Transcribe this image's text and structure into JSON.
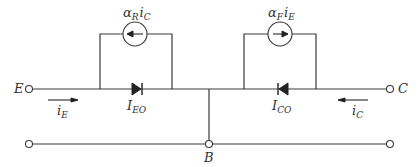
{
  "diagram": {
    "terminals": {
      "emitter": "E",
      "collector": "C",
      "base": "B"
    },
    "sources": {
      "reverse": {
        "coef": "α",
        "coef_sub": "R",
        "var": "i",
        "var_sub": "C"
      },
      "forward": {
        "coef": "α",
        "coef_sub": "F",
        "var": "i",
        "var_sub": "E"
      }
    },
    "diodes": {
      "emitter_diode": {
        "main": "I",
        "sub": "EO"
      },
      "collector_diode": {
        "main": "I",
        "sub": "CO"
      }
    },
    "currents": {
      "emitter_current": {
        "main": "i",
        "sub": "E"
      },
      "collector_current": {
        "main": "i",
        "sub": "C"
      }
    },
    "colors": {
      "line": "#3a3a3a",
      "text": "#333333",
      "background": "#ffffff"
    }
  }
}
